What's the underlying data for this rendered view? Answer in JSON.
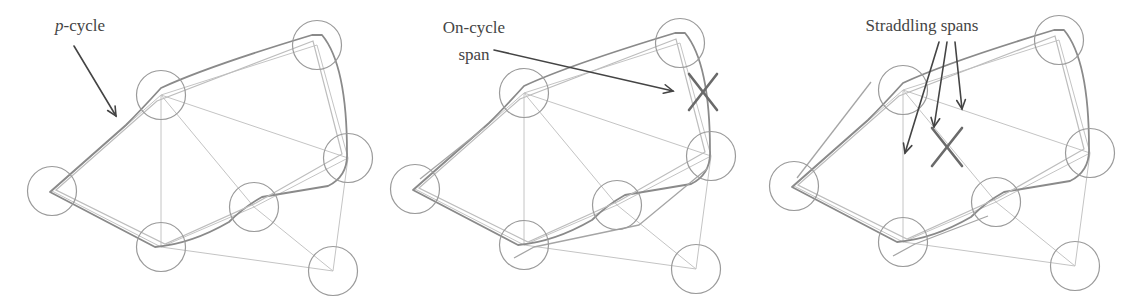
{
  "colors": {
    "node_stroke": "#9a9a9a",
    "span_stroke": "#c4c4c4",
    "cycle_stroke": "#8a8a8a",
    "arrow_stroke": "#444444",
    "failure_mark": "#6a6a6a",
    "text": "#454545"
  },
  "panels": [
    {
      "id": "p-cycle",
      "offset_x": 0,
      "offset_y": 0,
      "label": {
        "prefix_italic": "p",
        "text": "-cycle",
        "x": 55,
        "y": 31
      },
      "arrows": [
        {
          "x1": 74,
          "y1": 46,
          "x2": 116,
          "y2": 116
        }
      ],
      "failure_mark": null
    },
    {
      "id": "on-cycle-span",
      "offset_x": -17,
      "offset_y": -2,
      "label": {
        "lines": [
          "On-cycle",
          "span"
        ],
        "x": 474,
        "y": 33,
        "line_height": 27
      },
      "arrows": [
        {
          "x1": 494,
          "y1": 50,
          "x2": 673,
          "y2": 91
        }
      ],
      "failure_mark": {
        "cx": 703,
        "cy": 92,
        "dx": 14,
        "dy": 18
      }
    },
    {
      "id": "straddling-spans",
      "offset_x": -10,
      "offset_y": -5,
      "label": {
        "text": "Straddling spans",
        "x": 922,
        "y": 31
      },
      "arrows": [
        {
          "x1": 939,
          "y1": 42,
          "x2": 905,
          "y2": 153
        },
        {
          "x1": 947,
          "y1": 42,
          "x2": 934,
          "y2": 127
        },
        {
          "x1": 955,
          "y1": 42,
          "x2": 962,
          "y2": 109
        }
      ],
      "failure_mark": {
        "cx": 947,
        "cy": 147,
        "dx": 15,
        "dy": 19
      }
    }
  ],
  "graph": {
    "node_radius": 24.5,
    "nodes": [
      {
        "id": "A",
        "x": 52,
        "y": 191
      },
      {
        "id": "B",
        "x": 161,
        "y": 95
      },
      {
        "id": "C",
        "x": 317,
        "y": 45
      },
      {
        "id": "D",
        "x": 348,
        "y": 158
      },
      {
        "id": "E",
        "x": 254,
        "y": 207
      },
      {
        "id": "F",
        "x": 161,
        "y": 247
      },
      {
        "id": "G",
        "x": 333,
        "y": 271
      }
    ],
    "spans": [
      [
        "A",
        "B"
      ],
      [
        "B",
        "C"
      ],
      [
        "C",
        "D"
      ],
      [
        "D",
        "E"
      ],
      [
        "E",
        "F"
      ],
      [
        "F",
        "A"
      ],
      [
        "B",
        "F"
      ],
      [
        "B",
        "E"
      ],
      [
        "B",
        "D"
      ],
      [
        "E",
        "G"
      ],
      [
        "D",
        "G"
      ],
      [
        "F",
        "G"
      ]
    ]
  },
  "chart_data": {
    "type": "network-diagram",
    "panels": [
      "p-cycle",
      "On-cycle span",
      "Straddling spans"
    ],
    "nodes": [
      "A",
      "B",
      "C",
      "D",
      "E",
      "F",
      "G"
    ],
    "spans": [
      [
        "A",
        "B"
      ],
      [
        "B",
        "C"
      ],
      [
        "C",
        "D"
      ],
      [
        "D",
        "E"
      ],
      [
        "E",
        "F"
      ],
      [
        "F",
        "A"
      ],
      [
        "B",
        "F"
      ],
      [
        "B",
        "E"
      ],
      [
        "B",
        "D"
      ],
      [
        "E",
        "G"
      ],
      [
        "D",
        "G"
      ],
      [
        "F",
        "G"
      ]
    ],
    "p_cycle": [
      "A",
      "B",
      "C",
      "D",
      "E",
      "F",
      "A"
    ],
    "failed_on_cycle_span": [
      "C",
      "D"
    ],
    "failed_straddling_span": [
      "B",
      "E"
    ],
    "annotations": [
      "p-cycle",
      "On-cycle span",
      "Straddling spans"
    ]
  }
}
